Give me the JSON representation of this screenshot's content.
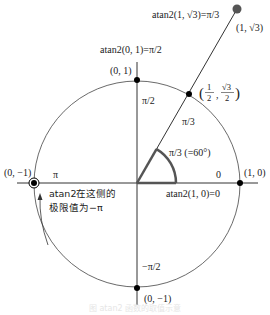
{
  "figure": {
    "colors": {
      "line": "#333333",
      "angle_arc": "#555555",
      "far_point": "#555555",
      "dot": "#000000"
    },
    "labels": {
      "ray_formula": "atan2(1, √3)=π/3",
      "far_point": "(1, √3)",
      "top_formula": "atan2(0, 1)=π/2",
      "top_point": "(0, 1)",
      "unit_point": "(1/2, √3/2)",
      "unit_point_num1": "1",
      "unit_point_den1": "2",
      "unit_point_num2": "√3",
      "unit_point_den2": "2",
      "pi_over_2": "π/2",
      "ray_pi_over_3": "π/3",
      "angle_label": "π/3 (=60°)",
      "left_point": "(0, −1)",
      "pi_label": "π",
      "zero_label": "0",
      "right_point": "(1, 0)",
      "right_formula": "atan2(1, 0)=0",
      "limit_note_line1": "atan2在这侧的",
      "limit_note_line2": "极限值为−π",
      "neg_pi_over_2": "−π/2",
      "bottom_point": "(0, −1)"
    },
    "caption": "图 atan2 函数的取值示意"
  }
}
